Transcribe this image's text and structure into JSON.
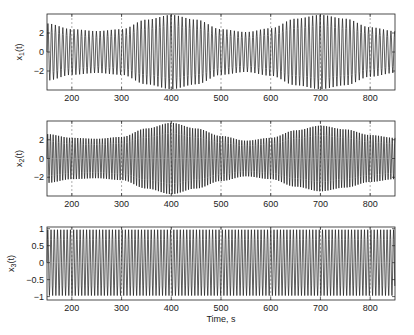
{
  "chart_data": [
    {
      "type": "line",
      "ylabel": "x_1(t)",
      "ylabel_main": "x",
      "ylabel_sub": "1",
      "ylabel_tail": "(t)",
      "xlim": [
        150,
        850
      ],
      "ylim": [
        -4,
        4
      ],
      "yticks": [
        -2,
        0,
        2
      ],
      "xticks": [
        200,
        300,
        400,
        500,
        600,
        700,
        800
      ],
      "grid": "x-dashed",
      "period_s": 7.5,
      "envelope": {
        "t": [
          150,
          200,
          250,
          300,
          350,
          400,
          450,
          500,
          550,
          600,
          650,
          700,
          750,
          800,
          850
        ],
        "amp": [
          3.0,
          2.4,
          2.2,
          2.4,
          3.4,
          3.9,
          3.4,
          2.4,
          2.1,
          2.5,
          3.5,
          3.9,
          3.5,
          2.6,
          2.2
        ]
      }
    },
    {
      "type": "line",
      "ylabel": "x_2(t)",
      "ylabel_main": "x",
      "ylabel_sub": "2",
      "ylabel_tail": "(t)",
      "xlim": [
        150,
        850
      ],
      "ylim": [
        -4,
        4
      ],
      "yticks": [
        -2,
        0,
        2
      ],
      "xticks": [
        200,
        300,
        400,
        500,
        600,
        700,
        800
      ],
      "grid": "x-dashed",
      "period_s": 5.5,
      "envelope": {
        "t": [
          150,
          200,
          250,
          300,
          350,
          400,
          450,
          500,
          550,
          600,
          650,
          700,
          750,
          800,
          850
        ],
        "amp": [
          2.6,
          2.2,
          2.1,
          2.3,
          3.2,
          3.8,
          3.2,
          2.4,
          1.9,
          2.2,
          3.0,
          3.5,
          3.1,
          2.5,
          2.2
        ]
      }
    },
    {
      "type": "line",
      "ylabel": "x_3(t)",
      "ylabel_main": "x",
      "ylabel_sub": "3",
      "ylabel_tail": "(t)",
      "xlabel": "Time, s",
      "xlim": [
        150,
        850
      ],
      "ylim": [
        -1.1,
        1.05
      ],
      "yticks": [
        -1,
        -0.5,
        0,
        0.5,
        1
      ],
      "ytick_labels": [
        "−1",
        "−0.5",
        "0",
        "0.5",
        "1"
      ],
      "xticks": [
        200,
        300,
        400,
        500,
        600,
        700,
        800
      ],
      "grid": "x-dashed",
      "period_s": 6.5,
      "envelope": {
        "t": [
          150,
          850
        ],
        "amp": [
          0.97,
          0.97
        ]
      }
    }
  ],
  "ytick_neg2": "−2"
}
